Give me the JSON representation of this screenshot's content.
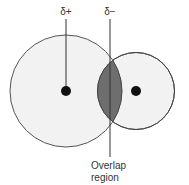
{
  "diagram": {
    "labels": {
      "delta_plus": "δ+",
      "delta_minus": "δ−",
      "overlap_line1": "Overlap",
      "overlap_line2": "region"
    },
    "colors": {
      "atom_fill": "#f2f2f2",
      "atom_stroke": "#555555",
      "overlap_fill": "#6e6e6e",
      "nucleus": "#111111",
      "text": "#333333"
    }
  }
}
